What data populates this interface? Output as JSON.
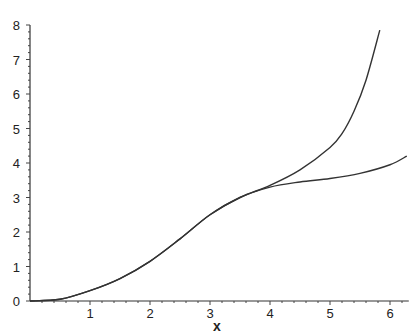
{
  "chart_data": {
    "type": "line",
    "title": "",
    "xlabel": "x",
    "ylabel": "",
    "xlim": [
      0,
      6.28
    ],
    "ylim": [
      0,
      8
    ],
    "xticks": [
      1,
      2,
      3,
      4,
      5,
      6
    ],
    "yticks": [
      0,
      1,
      2,
      3,
      4,
      5,
      6,
      7,
      8
    ],
    "grid": false,
    "legend": null,
    "series": [
      {
        "name": "curve-upper",
        "color": "#333333",
        "x": [
          0,
          0.5,
          1,
          1.5,
          2,
          2.5,
          3,
          3.5,
          4,
          4.5,
          5,
          5.2,
          5.4,
          5.6,
          5.83
        ],
        "values": [
          0,
          0.05,
          0.3,
          0.65,
          1.15,
          1.8,
          2.5,
          3.0,
          3.35,
          3.8,
          4.45,
          4.85,
          5.5,
          6.4,
          7.85
        ]
      },
      {
        "name": "curve-lower",
        "color": "#333333",
        "x": [
          0,
          0.5,
          1,
          1.5,
          2,
          2.5,
          3,
          3.5,
          4,
          4.5,
          5,
          5.5,
          6,
          6.28
        ],
        "values": [
          0,
          0.05,
          0.3,
          0.65,
          1.15,
          1.8,
          2.5,
          3.0,
          3.3,
          3.45,
          3.55,
          3.7,
          3.95,
          4.2
        ]
      }
    ]
  }
}
